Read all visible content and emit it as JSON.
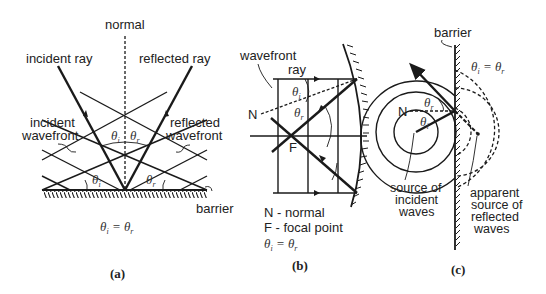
{
  "panel_a": {
    "caption": "(a)",
    "labels": {
      "normal": "normal",
      "incident_ray": "incident ray",
      "reflected_ray": "reflected ray",
      "incident_wavefront_1": "incident",
      "incident_wavefront_2": "wavefront",
      "reflected_wavefront_1": "reflected",
      "reflected_wavefront_2": "wavefront",
      "barrier": "barrier"
    },
    "angles": {
      "theta": "θ",
      "i": "i",
      "r": "r"
    },
    "equation": {
      "lhs": "θ",
      "lhs_sub": "i",
      "eq": " = ",
      "rhs": "θ",
      "rhs_sub": "r"
    }
  },
  "panel_b": {
    "caption": "(b)",
    "labels": {
      "wavefront": "wavefront",
      "ray": "ray",
      "N": "N",
      "F": "F"
    },
    "legend": {
      "line1": "N - normal",
      "line2": "F - focal point"
    },
    "angles": {
      "theta": "θ",
      "i": "i",
      "r": "r"
    },
    "equation": {
      "lhs": "θ",
      "lhs_sub": "i",
      "eq": " = ",
      "rhs": "θ",
      "rhs_sub": "r"
    }
  },
  "panel_c": {
    "caption": "(c)",
    "labels": {
      "barrier": "barrier",
      "N": "N",
      "source_incident_1": "source of",
      "source_incident_2": "incident",
      "source_incident_3": "waves",
      "apparent_1": "apparent",
      "apparent_2": "source of",
      "apparent_3": "reflected",
      "apparent_4": "waves"
    },
    "angles": {
      "theta": "θ",
      "i": "i",
      "r": "r"
    },
    "equation": {
      "lhs": "θ",
      "lhs_sub": "i",
      "eq": " = ",
      "rhs": "θ",
      "rhs_sub": "r"
    }
  }
}
